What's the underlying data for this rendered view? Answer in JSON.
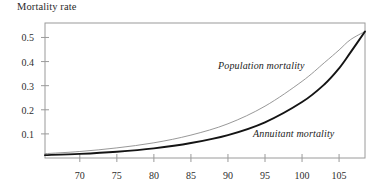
{
  "chart_data": {
    "type": "line",
    "title": "Mortality rate",
    "xlabel": "",
    "ylabel": "Mortality rate",
    "xlim": [
      65.3,
      108.5
    ],
    "ylim": [
      0,
      0.56
    ],
    "grid": false,
    "legend_position": "inline-annotations",
    "xticks": [
      70,
      75,
      80,
      85,
      90,
      95,
      100,
      105
    ],
    "xtick_labels": [
      "70",
      "75",
      "80",
      "85",
      "90",
      "95",
      "100",
      "105"
    ],
    "yticks": [
      0.1,
      0.2,
      0.3,
      0.4,
      0.5
    ],
    "ytick_labels": [
      "0.1",
      "0.2",
      "0.3",
      "0.4",
      "0.5"
    ],
    "series": [
      {
        "name": "Population mortality",
        "color": "#8c8c8c",
        "width": 0.9,
        "annotation": "Population mortality",
        "x": [
          65.3,
          70,
          75,
          80,
          85,
          90,
          95,
          100,
          103,
          105,
          106.5,
          108.5
        ],
        "values": [
          0.018,
          0.027,
          0.042,
          0.063,
          0.095,
          0.142,
          0.215,
          0.318,
          0.395,
          0.448,
          0.49,
          0.525
        ]
      },
      {
        "name": "Annuitant mortality",
        "color": "#141414",
        "width": 1.9,
        "annotation": "Annuitant mortality",
        "x": [
          65.3,
          70,
          75,
          80,
          85,
          90,
          95,
          100,
          103,
          105,
          106.5,
          108.5
        ],
        "values": [
          0.012,
          0.017,
          0.026,
          0.04,
          0.062,
          0.095,
          0.148,
          0.232,
          0.305,
          0.372,
          0.436,
          0.525
        ]
      }
    ]
  },
  "annotations": {
    "population_label": "Population mortality",
    "annuitant_label": "Annuitant mortality"
  },
  "colors": {
    "axis": "#9a9a9a",
    "population_curve": "#8c8c8c",
    "annuitant_curve": "#141414",
    "text": "#2b2b2b",
    "background": "#ffffff"
  }
}
